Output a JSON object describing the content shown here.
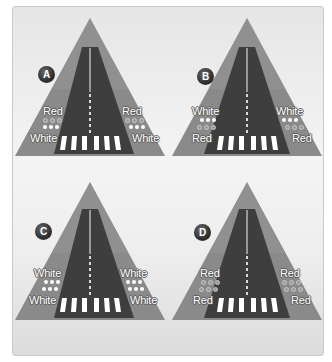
{
  "figure": {
    "panels": [
      {
        "id": "A",
        "badge": "A",
        "left": {
          "upper_label": "Red",
          "upper_dots": "red",
          "lower_dots": "white",
          "lower_label": "White"
        },
        "right": {
          "upper_label": "Red",
          "upper_dots": "red",
          "lower_dots": "white",
          "lower_label": "White"
        }
      },
      {
        "id": "B",
        "badge": "B",
        "left": {
          "upper_label": "White",
          "upper_dots": "white",
          "lower_dots": "red",
          "lower_label": "Red"
        },
        "right": {
          "upper_label": "White",
          "upper_dots": "white",
          "lower_dots": "red",
          "lower_label": "Red"
        }
      },
      {
        "id": "C",
        "badge": "C",
        "left": {
          "upper_label": "White",
          "upper_dots": "white",
          "lower_dots": "white",
          "lower_label": "White"
        },
        "right": {
          "upper_label": "White",
          "upper_dots": "white",
          "lower_dots": "white",
          "lower_label": "White"
        }
      },
      {
        "id": "D",
        "badge": "D",
        "left": {
          "upper_label": "Red",
          "upper_dots": "red",
          "lower_dots": "red",
          "lower_label": "Red"
        },
        "right": {
          "upper_label": "Red",
          "upper_dots": "red",
          "lower_dots": "red",
          "lower_label": "Red"
        }
      }
    ],
    "colors": {
      "approach_area": "#8c8c8c",
      "runway": "#3d3d3d",
      "markings": "#ffffff",
      "badge": "#2f2f2f",
      "frame_bg": "#eeeeee"
    }
  }
}
